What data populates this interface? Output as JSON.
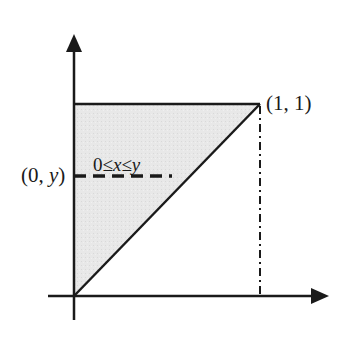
{
  "diagram": {
    "colors": {
      "line": "#1a1a1a",
      "fill": "#e6e6e6",
      "background": "#ffffff"
    },
    "labels": {
      "corner_point": "(1, 1)",
      "left_point_open": "(0, ",
      "left_point_var": "y",
      "left_point_close": ")",
      "inequality_a": "0≤",
      "inequality_x": "x",
      "inequality_b": "≤",
      "inequality_y": "y"
    },
    "geometry": {
      "origin": [
        74,
        296
      ],
      "corner": [
        260,
        104
      ],
      "y_axis_top": [
        74,
        34
      ],
      "y_axis_bottom": [
        74,
        320
      ],
      "x_axis_left": [
        48,
        296
      ],
      "x_axis_right": [
        329,
        296
      ],
      "dashed_slice_y": 176,
      "dashed_slice_x_end": 172
    },
    "elements": [
      {
        "type": "axis",
        "name": "x-axis",
        "direction": "right",
        "arrow": true
      },
      {
        "type": "axis",
        "name": "y-axis",
        "direction": "up",
        "arrow": true
      },
      {
        "type": "region",
        "name": "shaded-triangle",
        "vertices": [
          "(0,0)",
          "(0,1)",
          "(1,1)"
        ]
      },
      {
        "type": "line",
        "name": "top-edge",
        "style": "solid",
        "from": "(0,1)",
        "to": "(1,1)"
      },
      {
        "type": "line",
        "name": "diagonal",
        "style": "solid",
        "from": "(0,0)",
        "to": "(1,1)"
      },
      {
        "type": "line",
        "name": "vertical-x1",
        "style": "dash-dot",
        "from": "(1,1)",
        "to": "(1,0)"
      },
      {
        "type": "line",
        "name": "horizontal-slice",
        "style": "dashed",
        "from": "(0,y)",
        "to": "(y,y)"
      }
    ]
  }
}
